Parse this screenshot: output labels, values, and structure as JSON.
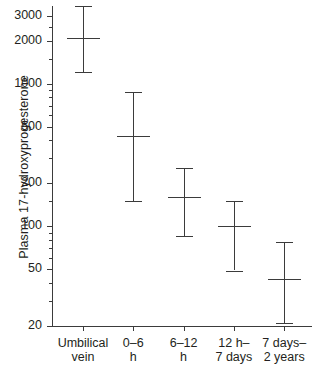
{
  "chart_data": {
    "type": "scatter",
    "title": "",
    "xlabel": "",
    "ylabel": "Plasma 17-hydroxyprogesterone",
    "yscale": "log",
    "ylim": [
      20,
      3500
    ],
    "ytick_labels": [
      "3000",
      "2000",
      "1000",
      "500",
      "200",
      "100",
      "50",
      "20"
    ],
    "ytick_values": [
      3000,
      2000,
      1000,
      500,
      200,
      100,
      50,
      20
    ],
    "grid": false,
    "legend": "none",
    "categories": [
      "Umbilical\nvein",
      "0–6\nh",
      "6–12\nh",
      "12 h–\n7 days",
      "7 days–\n2 years"
    ],
    "category_lines": [
      [
        "Umbilical",
        "vein"
      ],
      [
        "0–6",
        "h"
      ],
      [
        "6–12",
        "h"
      ],
      [
        "12 h–",
        "7 days"
      ],
      [
        "7 days–",
        "2 years"
      ]
    ],
    "series": [
      {
        "name": "median with range",
        "medians": [
          2100,
          430,
          160,
          100,
          43
        ],
        "low": [
          1200,
          150,
          85,
          49,
          21
        ],
        "high": [
          3500,
          870,
          255,
          150,
          78
        ]
      }
    ],
    "points": [
      {
        "category": "Umbilical vein",
        "median": 2100,
        "low": 1200,
        "high": 3500
      },
      {
        "category": "0–6 h",
        "median": 430,
        "low": 150,
        "high": 870
      },
      {
        "category": "6–12 h",
        "median": 160,
        "low": 85,
        "high": 255
      },
      {
        "category": "12 h–7 days",
        "median": 100,
        "low": 49,
        "high": 150
      },
      {
        "category": "7 days–2 years",
        "median": 43,
        "low": 21,
        "high": 78
      }
    ],
    "colors": {
      "line": "#3b3b3b",
      "text": "#231f20",
      "background": "#ffffff"
    }
  }
}
